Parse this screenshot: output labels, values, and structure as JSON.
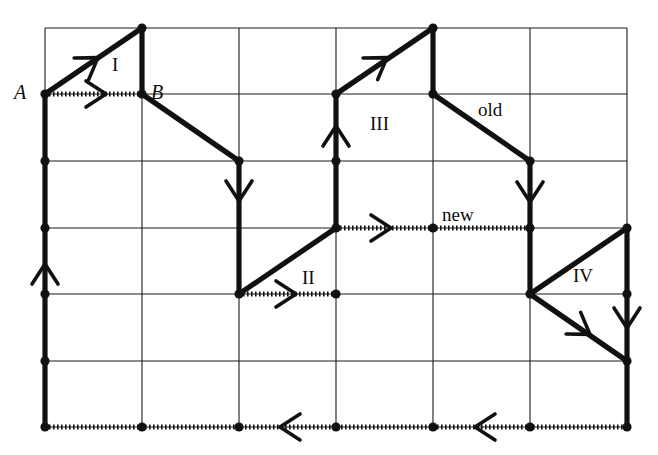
{
  "figure": {
    "type": "lattice-path-diagram",
    "width": 658,
    "height": 455,
    "background_color": "#ffffff",
    "line_color": "#111111",
    "grid_color": "#1a1a1a",
    "grid": {
      "columns": 6,
      "rows": 6,
      "x_lines": [
        45,
        142,
        239,
        336,
        433,
        530,
        627
      ],
      "y_lines": [
        28,
        94,
        161,
        228,
        294,
        361,
        427
      ],
      "cell_width": 97,
      "cell_height": 66.5
    },
    "labels": [
      {
        "text": "A",
        "kind": "point",
        "x": 14,
        "y": 82
      },
      {
        "text": "B",
        "kind": "point",
        "x": 151,
        "y": 82
      },
      {
        "text": "I",
        "kind": "region",
        "x": 112,
        "y": 55
      },
      {
        "text": "II",
        "kind": "region",
        "x": 302,
        "y": 268
      },
      {
        "text": "III",
        "kind": "region",
        "x": 370,
        "y": 114
      },
      {
        "text": "IV",
        "kind": "region",
        "x": 573,
        "y": 266
      },
      {
        "text": "old",
        "kind": "edge",
        "x": 478,
        "y": 100
      },
      {
        "text": "new",
        "kind": "edge",
        "x": 442,
        "y": 205
      }
    ],
    "solid_paths": [
      {
        "name": "triangle-I-hypotenuse",
        "points": [
          [
            45,
            94
          ],
          [
            142,
            28
          ]
        ]
      },
      {
        "name": "triangle-I-right-side",
        "points": [
          [
            142,
            28
          ],
          [
            142,
            94
          ]
        ]
      },
      {
        "name": "B-to-down-right-diagonal",
        "points": [
          [
            142,
            94
          ],
          [
            239,
            161
          ]
        ]
      },
      {
        "name": "down-from-239-161",
        "points": [
          [
            239,
            161
          ],
          [
            239,
            294
          ]
        ]
      },
      {
        "name": "left-border-vertical",
        "points": [
          [
            45,
            94
          ],
          [
            45,
            427
          ]
        ]
      },
      {
        "name": "triangle-II-hypotenuse",
        "points": [
          [
            239,
            294
          ],
          [
            336,
            228
          ]
        ]
      },
      {
        "name": "up-from-336-228",
        "points": [
          [
            336,
            228
          ],
          [
            336,
            94
          ]
        ]
      },
      {
        "name": "triangle-III-hypotenuse",
        "points": [
          [
            336,
            94
          ],
          [
            433,
            28
          ]
        ]
      },
      {
        "name": "triangle-III-right-side",
        "points": [
          [
            433,
            28
          ],
          [
            433,
            94
          ]
        ]
      },
      {
        "name": "old-diagonal",
        "points": [
          [
            433,
            94
          ],
          [
            530,
            161
          ]
        ]
      },
      {
        "name": "down-from-530-161",
        "points": [
          [
            530,
            161
          ],
          [
            530,
            294
          ]
        ]
      },
      {
        "name": "triangle-IV-hypotenuse",
        "points": [
          [
            530,
            294
          ],
          [
            627,
            228
          ]
        ]
      },
      {
        "name": "right-border-vertical",
        "points": [
          [
            627,
            228
          ],
          [
            627,
            427
          ]
        ]
      },
      {
        "name": "IV-lower-diagonal",
        "points": [
          [
            530,
            294
          ],
          [
            627,
            361
          ]
        ]
      }
    ],
    "dotted_paths": [
      {
        "name": "A-to-B-dotted",
        "points": [
          [
            45,
            94
          ],
          [
            142,
            94
          ]
        ]
      },
      {
        "name": "II-base-dotted",
        "points": [
          [
            239,
            294
          ],
          [
            336,
            294
          ]
        ]
      },
      {
        "name": "new-dotted",
        "points": [
          [
            336,
            228
          ],
          [
            530,
            228
          ]
        ]
      },
      {
        "name": "bottom-border-dotted",
        "points": [
          [
            45,
            427
          ],
          [
            627,
            427
          ]
        ]
      }
    ],
    "arrows": [
      {
        "name": "arrow-A-to-apex",
        "x": 93,
        "y": 61,
        "angle": -34
      },
      {
        "name": "arrow-A-to-B",
        "x": 100,
        "y": 94,
        "angle": 0
      },
      {
        "name": "arrow-B-down-right",
        "x": 239,
        "y": 195,
        "angle": 90
      },
      {
        "name": "arrow-left-border-up",
        "x": 45,
        "y": 270,
        "angle": -90
      },
      {
        "name": "arrow-II-base",
        "x": 290,
        "y": 294,
        "angle": 0
      },
      {
        "name": "arrow-III-up",
        "x": 336,
        "y": 132,
        "angle": -90
      },
      {
        "name": "arrow-III-diagonal",
        "x": 382,
        "y": 61,
        "angle": -34
      },
      {
        "name": "arrow-new-right",
        "x": 385,
        "y": 228,
        "angle": 0
      },
      {
        "name": "arrow-old-down",
        "x": 530,
        "y": 196,
        "angle": 90
      },
      {
        "name": "arrow-IV-lower",
        "x": 585,
        "y": 331,
        "angle": 34
      },
      {
        "name": "arrow-right-border",
        "x": 627,
        "y": 322,
        "angle": 90
      },
      {
        "name": "arrow-bottom-left-1",
        "x": 286,
        "y": 427,
        "angle": 180
      },
      {
        "name": "arrow-bottom-left-2",
        "x": 481,
        "y": 427,
        "angle": 180
      }
    ],
    "vertices": [
      [
        45,
        94
      ],
      [
        45,
        161
      ],
      [
        45,
        228
      ],
      [
        45,
        294
      ],
      [
        45,
        361
      ],
      [
        45,
        427
      ],
      [
        142,
        28
      ],
      [
        142,
        94
      ],
      [
        142,
        427
      ],
      [
        239,
        161
      ],
      [
        239,
        294
      ],
      [
        239,
        427
      ],
      [
        336,
        94
      ],
      [
        336,
        161
      ],
      [
        336,
        228
      ],
      [
        336,
        294
      ],
      [
        336,
        427
      ],
      [
        433,
        28
      ],
      [
        433,
        94
      ],
      [
        433,
        228
      ],
      [
        433,
        427
      ],
      [
        530,
        161
      ],
      [
        530,
        228
      ],
      [
        530,
        294
      ],
      [
        530,
        427
      ],
      [
        627,
        228
      ],
      [
        627,
        294
      ],
      [
        627,
        361
      ],
      [
        627,
        427
      ]
    ]
  }
}
